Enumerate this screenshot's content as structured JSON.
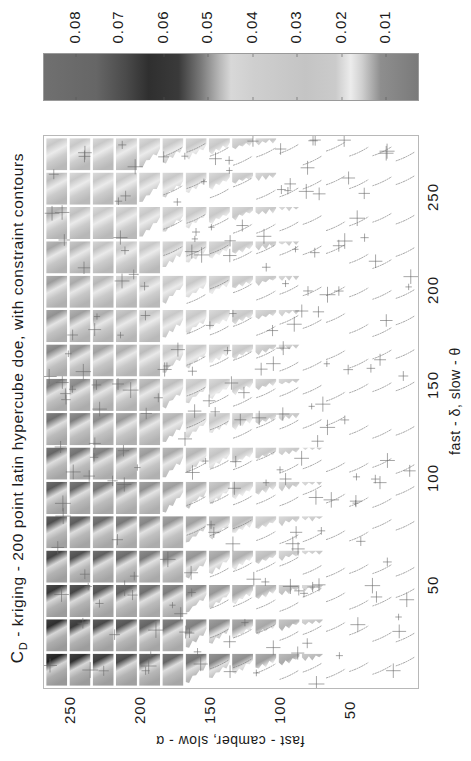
{
  "chart_data": {
    "type": "heatmap",
    "title_main": "C",
    "title_sub": "D",
    "title_rest": " - kriging - 200 point latin hypercube doe, with constraint contours",
    "xlabel": "fast - δ, slow - θ",
    "ylabel": "fast - camber, slow - α",
    "x_ticks": [
      50,
      100,
      150,
      200,
      250
    ],
    "y_ticks": [
      250,
      200,
      150,
      100,
      50
    ],
    "grid": {
      "rows": 16,
      "cols": 16,
      "description": "trellis of 16x16 small kriging response-surface panels; panels with infeasible constraint regions blanked white, constraint contours drawn as thin lines, DOE sample points as '+' markers"
    },
    "colorbar": {
      "ticks": [
        "0.08",
        "0.07",
        "0.06",
        "0.05",
        "0.04",
        "0.03",
        "0.02",
        "0.01"
      ],
      "range": [
        0.005,
        0.088
      ],
      "orientation": "rotated, values decreasing left to right"
    },
    "orientation": "figure rotated 90° counter-clockwise"
  },
  "colors": {
    "dark": "#2e2e2e",
    "mid": "#8a8a8a",
    "light": "#cfcfcf",
    "highlight": "#efefef",
    "contour": "#7a7a7a",
    "marker": "#6a6a6a",
    "frame": "#b8b8b8"
  }
}
